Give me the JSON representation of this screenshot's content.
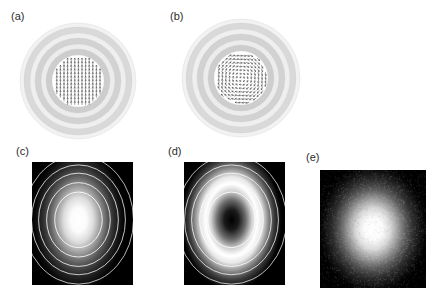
{
  "figure": {
    "width": 439,
    "height": 298,
    "background": "#ffffff",
    "caption_labels": {
      "a": "(a)",
      "b": "(b)",
      "c": "(c)",
      "d": "(d)",
      "e": "(e)"
    }
  },
  "panels": [
    {
      "id": "a",
      "label": "(a)",
      "kind": "vector-field",
      "description": "Concentric grey intensity rings with white inner disk containing a grid of short vertical arrows (uniform linear polarization).",
      "x": 18,
      "y": 22,
      "width": 120,
      "height": 118,
      "center_x": 78,
      "center_y": 81,
      "ring_colors": [
        "#f2f2f2",
        "#d9d9d9",
        "#efefef",
        "#d2d2d2",
        "#ececec",
        "#cdcdcd",
        "#e8e8e8"
      ],
      "ring_radii": [
        58,
        54,
        48,
        43,
        37,
        32,
        26
      ],
      "inner_disk_radius": 26,
      "inner_disk_color": "#ffffff",
      "arrow_color": "#4d4d4d",
      "arrow_grid_spacing": 3.6,
      "arrow_length": 3.0,
      "arrow_pattern": "uniform-vertical"
    },
    {
      "id": "b",
      "label": "(b)",
      "kind": "vector-field",
      "description": "Same concentric grey rings; inner white disk contains a swirling vortex vector field with azimuthally varying arrow directions.",
      "x": 180,
      "y": 18,
      "width": 122,
      "height": 120,
      "center_x": 241,
      "center_y": 78,
      "ring_colors": [
        "#f2f2f2",
        "#d9d9d9",
        "#efefef",
        "#d2d2d2",
        "#ececec",
        "#cdcdcd",
        "#e8e8e8"
      ],
      "ring_radii": [
        59,
        55,
        49,
        44,
        38,
        33,
        27
      ],
      "inner_disk_radius": 27,
      "inner_disk_color": "#ffffff",
      "arrow_color": "#4d4d4d",
      "arrow_grid_spacing": 3.6,
      "arrow_length": 3.0,
      "arrow_pattern": "vortex-spiral"
    },
    {
      "id": "c",
      "label": "(c)",
      "kind": "intensity-map",
      "description": "Black background intensity map with bright Gaussian central lobe and overlaid white concentric contour rings.",
      "x": 32,
      "y": 162,
      "width": 101,
      "height": 123,
      "background": "#000000",
      "blob_type": "gaussian",
      "blob_center_x": 0.46,
      "blob_center_y": 0.47,
      "blob_radius_x": 0.24,
      "blob_radius_y": 0.3,
      "peak_color": "#ffffff",
      "contour_color": "#ffffff",
      "contour_count": 5,
      "contour_radii": [
        0.235,
        0.315,
        0.395,
        0.465,
        0.545
      ],
      "contour_center_x": 0.46,
      "contour_center_y": 0.47
    },
    {
      "id": "d",
      "label": "(d)",
      "kind": "intensity-map",
      "description": "Black background intensity map with annular doughnut intensity (dark core) and overlaid white concentric contour rings.",
      "x": 184,
      "y": 162,
      "width": 101,
      "height": 123,
      "background": "#000000",
      "blob_type": "doughnut",
      "blob_center_x": 0.47,
      "blob_center_y": 0.47,
      "blob_radius_x": 0.26,
      "blob_radius_y": 0.3,
      "ring_peak_fraction": 0.55,
      "core_color": "#000000",
      "peak_color": "#ffffff",
      "contour_color": "#ffffff",
      "contour_count": 5,
      "contour_radii": [
        0.235,
        0.315,
        0.395,
        0.465,
        0.545
      ],
      "contour_center_x": 0.47,
      "contour_center_y": 0.47
    },
    {
      "id": "e",
      "label": "(e)",
      "kind": "experimental-image",
      "description": "Noisy measured camera image on black background showing a diffuse Gaussian bright spot, no contour overlay.",
      "x": 320,
      "y": 170,
      "width": 106,
      "height": 118,
      "background": "#000000",
      "blob_type": "gaussian-noisy",
      "blob_center_x": 0.5,
      "blob_center_y": 0.5,
      "blob_radius_x": 0.26,
      "blob_radius_y": 0.28,
      "peak_color": "#ffffff",
      "noise": true,
      "contour_count": 0
    }
  ],
  "chart_data": {
    "type": "heatmap",
    "title": "",
    "xlabel": "",
    "ylabel": "",
    "panels": [
      {
        "panel": "a",
        "type": "vector-field",
        "field": "uniform-linear-vertical",
        "arrow_angles_deg": "90 everywhere (pointing up/down)",
        "rings": 7,
        "ring_gray_levels": [
          242,
          217,
          239,
          210,
          236,
          205,
          232
        ]
      },
      {
        "panel": "b",
        "type": "vector-field",
        "field": "vortex-azimuthal",
        "arrow_angles_deg": "theta + 90 (azimuthal swirl about centre)",
        "rings": 7,
        "ring_gray_levels": [
          242,
          217,
          239,
          210,
          236,
          205,
          232
        ]
      },
      {
        "panel": "c",
        "type": "heatmap",
        "profile": "gaussian",
        "radial_intensity_r": [
          0.0,
          0.1,
          0.2,
          0.3,
          0.4,
          0.5,
          0.6,
          0.8,
          1.0
        ],
        "radial_intensity_I": [
          1.0,
          0.92,
          0.72,
          0.46,
          0.24,
          0.1,
          0.04,
          0.01,
          0.0
        ],
        "contours": 5,
        "contour_levels_r": [
          0.235,
          0.315,
          0.395,
          0.465,
          0.545
        ]
      },
      {
        "panel": "d",
        "type": "heatmap",
        "profile": "doughnut",
        "radial_intensity_r": [
          0.0,
          0.08,
          0.16,
          0.24,
          0.32,
          0.4,
          0.5,
          0.65,
          0.85,
          1.0
        ],
        "radial_intensity_I": [
          0.0,
          0.18,
          0.58,
          0.92,
          1.0,
          0.78,
          0.42,
          0.14,
          0.02,
          0.0
        ],
        "contours": 5,
        "contour_levels_r": [
          0.235,
          0.315,
          0.395,
          0.465,
          0.545
        ]
      },
      {
        "panel": "e",
        "type": "heatmap",
        "profile": "gaussian-measured-noisy",
        "radial_intensity_r": [
          0.0,
          0.1,
          0.2,
          0.3,
          0.4,
          0.55,
          0.75,
          1.0
        ],
        "radial_intensity_I": [
          1.0,
          0.88,
          0.64,
          0.38,
          0.18,
          0.06,
          0.01,
          0.0
        ],
        "contours": 0
      }
    ],
    "legend_position": "none",
    "grid": false
  }
}
